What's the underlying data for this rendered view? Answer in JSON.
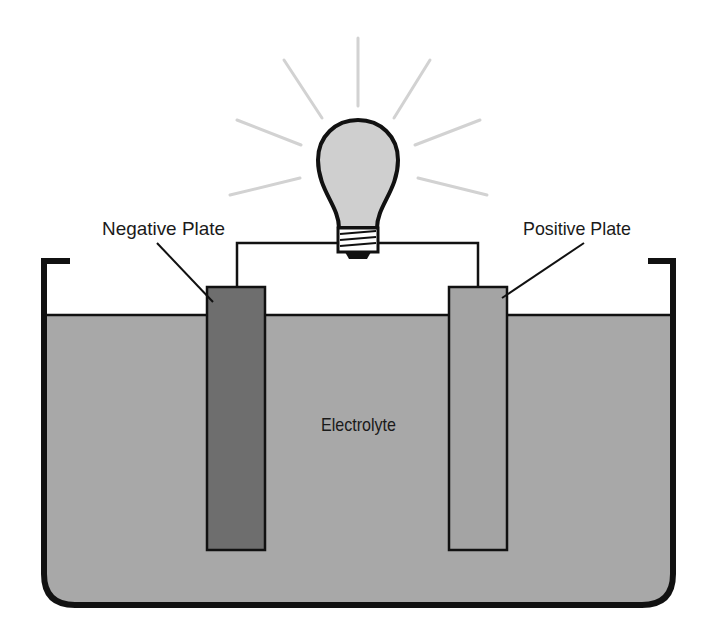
{
  "diagram": {
    "type": "electrochemical-cell",
    "labels": {
      "negative_plate": "Negative Plate",
      "positive_plate": "Positive Plate",
      "electrolyte": "Electrolyte"
    },
    "colors": {
      "electrolyte": "#a8a8a8",
      "negative_plate": "#6e6e6e",
      "positive_plate": "#a4a4a4",
      "bulb_glass": "#cfcfcf",
      "rays": "#d0d0d0",
      "outline": "#111111"
    },
    "icons": [
      "light-bulb-icon"
    ]
  }
}
